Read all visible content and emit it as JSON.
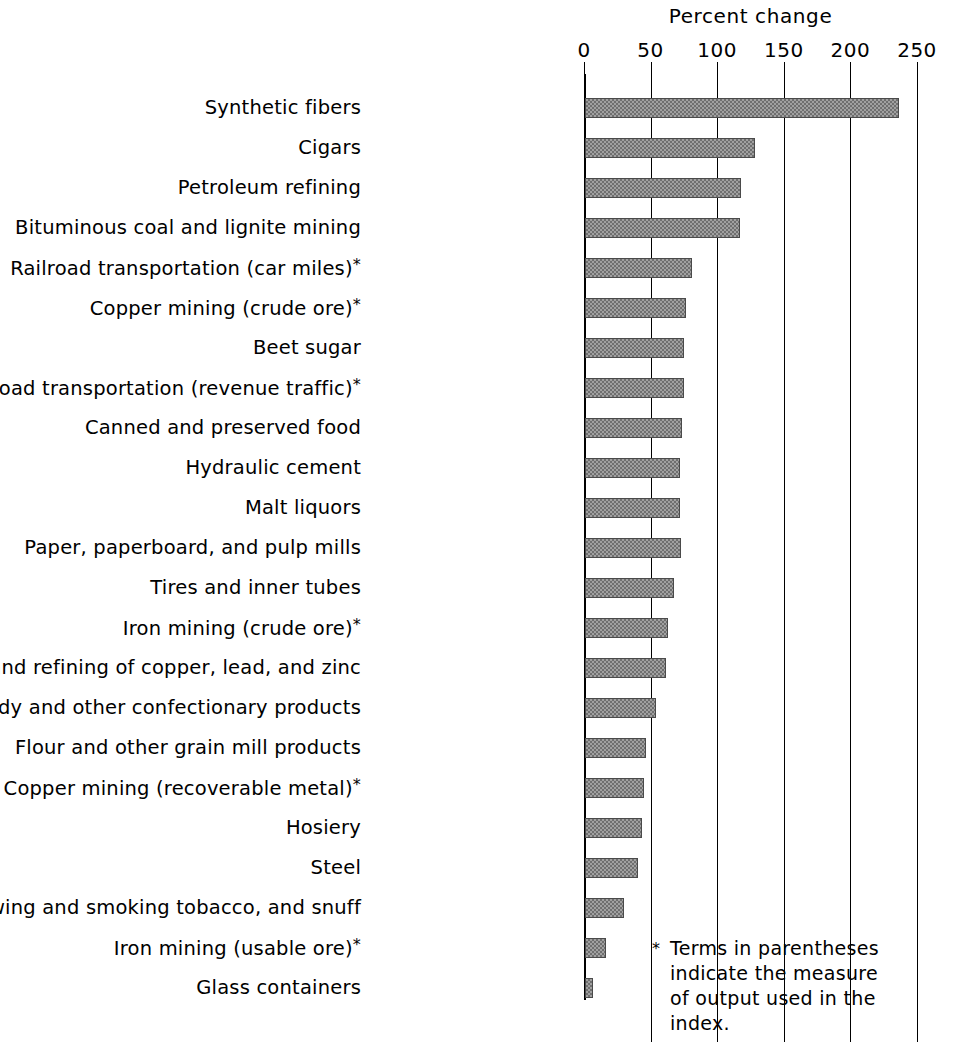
{
  "chart_data": {
    "type": "bar",
    "orientation": "horizontal",
    "title": "Percent change",
    "xlabel": "Percent change",
    "ylabel": "",
    "xlim": [
      0,
      250
    ],
    "xticks": [
      0,
      50,
      100,
      150,
      200,
      250
    ],
    "xtick_labels": [
      "0",
      "50",
      "100",
      "150",
      "200",
      "250"
    ],
    "grid": true,
    "legend": null,
    "bar_color": "#a0a0a0",
    "bar_edge_color": "#4a4a4a",
    "categories": [
      "Synthetic fibers",
      "Cigars",
      "Petroleum refining",
      "Bituminous coal and lignite mining",
      "Railroad transportation (car miles)*",
      "Copper mining (crude ore)*",
      "Beet sugar",
      "Railroad transportation (revenue traffic)*",
      "Canned and preserved food",
      "Hydraulic cement",
      "Malt liquors",
      "Paper, paperboard, and pulp mills",
      "Tires and inner tubes",
      "Iron mining (crude ore)*",
      "Smelting and refining of  copper, lead, and zinc",
      "Candy and other confectionary products",
      "Flour and other grain mill products",
      "Copper mining (recoverable metal)*",
      "Hosiery",
      "Steel",
      "Cigarettes, chewing and smoking tobacco, and snuff",
      "Iron mining (usable ore)*",
      "Glass containers"
    ],
    "values": [
      236,
      128,
      117,
      116,
      80,
      76,
      74,
      74,
      73,
      71,
      71,
      72,
      67,
      62,
      61,
      53,
      46,
      44,
      43,
      40,
      29,
      16,
      6
    ],
    "annotations": [
      "* Terms in parentheses indicate the measure of output used in the index."
    ]
  },
  "footnote": {
    "marker": "*",
    "lines": [
      "Terms in parentheses",
      "indicate the measure",
      "of output used in the",
      "index."
    ],
    "text": "Terms in parentheses indicate the measure of output used in the index."
  }
}
